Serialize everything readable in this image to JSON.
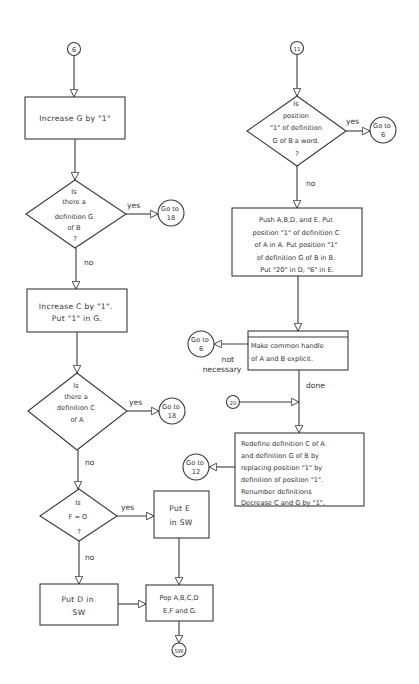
{
  "diagram": {
    "type": "flowchart",
    "left_flow": {
      "entry_connector": "6",
      "step1_box": "Increase G by \"1\"",
      "decision1": {
        "lines": [
          "Is",
          "there a",
          "definition G",
          "of B",
          "?"
        ],
        "yes_label": "yes",
        "yes_target": [
          "Go to",
          "18"
        ],
        "no_label": "no"
      },
      "step2_box": [
        "Increase C by \"1\".",
        "Put \"1\" in G."
      ],
      "decision2": {
        "lines": [
          "Is",
          "there a",
          "definition C",
          "of A"
        ],
        "yes_label": "yes",
        "yes_target": [
          "Go to",
          "18"
        ],
        "no_label": "no"
      },
      "decision3": {
        "lines": [
          "Is",
          "F = O",
          "?"
        ],
        "yes_label": "yes",
        "no_label": "no"
      },
      "put_e_box": [
        "Put E",
        "in SW"
      ],
      "put_d_box": [
        "Put D in",
        "SW"
      ],
      "pop_box": [
        "Pop A,B,C,D",
        "E,F and G."
      ],
      "exit_connector": "SW"
    },
    "right_flow": {
      "entry_connector": "11",
      "decision": {
        "lines": [
          "Is",
          "position",
          "\"1\" of definition",
          "G of B a word.",
          "?"
        ],
        "yes_label": "yes",
        "yes_target": [
          "Go to",
          "6"
        ],
        "no_label": "no"
      },
      "push_box": [
        "Push A,B,D, and E.  Put",
        "position \"1\" of definition C",
        "of A in A.  Put position \"1\"",
        "of definition G of B in B.",
        "Put \"20\" in D, \"6\" in E."
      ],
      "handle_box": [
        "Make common handle",
        "of A and B explicit."
      ],
      "handle_not_necessary": {
        "label": [
          "not",
          "necessary"
        ],
        "target": [
          "Go to",
          "6"
        ]
      },
      "done_label": "done",
      "join_connector": "20",
      "redefine_box": [
        "Redefine definition C of A",
        "and definition G of B by",
        "replacing position \"1\" by",
        "definition of position \"1\".",
        "Renumber definitions",
        "Decrease C and G by \"1\"."
      ],
      "redefine_target": [
        "Go to",
        "12"
      ]
    }
  }
}
